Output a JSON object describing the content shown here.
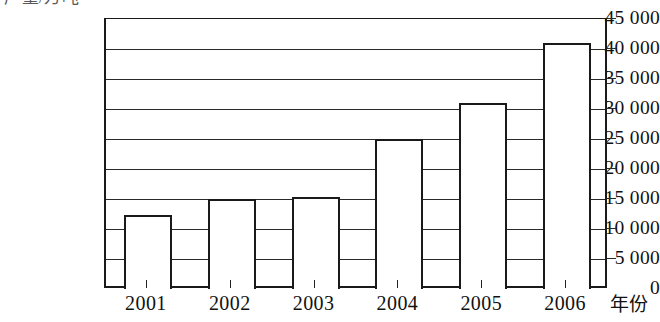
{
  "caption": {
    "unit_label": "产量/万吨"
  },
  "axis": {
    "x_title": "年份"
  },
  "chart_data": {
    "type": "bar",
    "title": "",
    "subtitle": "",
    "xlabel": "年份",
    "ylabel": "",
    "categories": [
      "2001",
      "2002",
      "2003",
      "2004",
      "2005",
      "2006"
    ],
    "values": [
      12400,
      15000,
      15300,
      25000,
      31000,
      41000
    ],
    "ylim": [
      0,
      45000
    ],
    "ytick_values": [
      0,
      5000,
      10000,
      15000,
      20000,
      25000,
      30000,
      35000,
      40000,
      45000
    ],
    "ytick_labels": [
      "0",
      "5 000",
      "10 000",
      "15 000",
      "20 000",
      "25 000",
      "30 000",
      "35 000",
      "40 000",
      "45 000"
    ],
    "grid": true,
    "grid_orientation": "horizontal",
    "legend": null,
    "legend_position": "none",
    "bar_fill": "#ffffff",
    "bar_stroke": "#1a1a1a",
    "axis_color": "#1a1a1a",
    "grid_color": "#2a2a2a"
  }
}
